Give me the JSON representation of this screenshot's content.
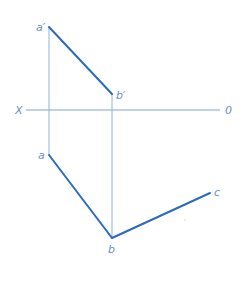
{
  "diagram": {
    "type": "orthographic-projection",
    "colors": {
      "thick_line": "#2a6bbf",
      "thin_line": "#8fb2de",
      "label": "#6a8fc7"
    },
    "axis": {
      "left_label": "X",
      "right_label": "0"
    },
    "points": {
      "a_prime": "a′",
      "b_prime": "b′",
      "a": "a",
      "b": "b",
      "c": "c"
    },
    "segments": [
      {
        "name": "a-prime-b-prime",
        "from": "a′",
        "to": "b′",
        "view": "front"
      },
      {
        "name": "a-b",
        "from": "a",
        "to": "b",
        "view": "top"
      },
      {
        "name": "b-c",
        "from": "b",
        "to": "c",
        "view": "top"
      }
    ],
    "projectors": [
      {
        "name": "a-projector",
        "from": "a′",
        "to": "a"
      },
      {
        "name": "b-projector",
        "from": "b′",
        "to": "b"
      }
    ]
  }
}
